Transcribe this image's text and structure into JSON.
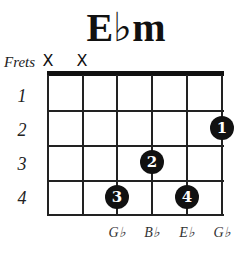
{
  "title": {
    "root": "E",
    "accidental": "♭",
    "quality": "m"
  },
  "frets_label": "Frets",
  "muted_strings": [
    {
      "string": 1,
      "symbol": "X"
    },
    {
      "string": 2,
      "symbol": "X"
    }
  ],
  "fret_numbers": [
    "1",
    "2",
    "3",
    "4"
  ],
  "fingers": [
    {
      "finger": "1",
      "string": 6,
      "fret": 2
    },
    {
      "finger": "2",
      "string": 4,
      "fret": 3
    },
    {
      "finger": "3",
      "string": 3,
      "fret": 4
    },
    {
      "finger": "4",
      "string": 5,
      "fret": 4
    }
  ],
  "string_notes": [
    {
      "string": 3,
      "note": "G♭"
    },
    {
      "string": 4,
      "note": "B♭"
    },
    {
      "string": 5,
      "note": "E♭"
    },
    {
      "string": 6,
      "note": "G♭"
    }
  ]
}
